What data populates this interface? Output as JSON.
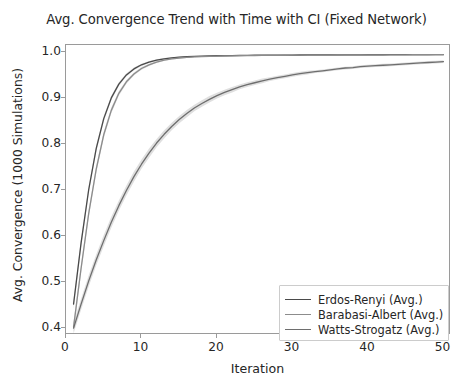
{
  "chart_data": {
    "type": "line",
    "title": "Avg. Convergence Trend with Time with CI (Fixed Network)",
    "xlabel": "Iteration",
    "ylabel": "Avg. Convergence (1000 Simulations)",
    "xlim": [
      0,
      51
    ],
    "ylim": [
      0.385,
      1.015
    ],
    "xticks": [
      0,
      10,
      20,
      30,
      40,
      50
    ],
    "xtick_labels": [
      "0",
      "10",
      "20",
      "30",
      "40",
      "50"
    ],
    "yticks": [
      0.4,
      0.5,
      0.6,
      0.7,
      0.8,
      0.9,
      1.0
    ],
    "ytick_labels": [
      "0.4",
      "0.5",
      "0.6",
      "0.7",
      "0.8",
      "0.9",
      "1.0"
    ],
    "grid": false,
    "legend_position": "lower right",
    "confidence_interval": true,
    "x": [
      1,
      2,
      3,
      4,
      5,
      6,
      7,
      8,
      9,
      10,
      11,
      12,
      13,
      14,
      15,
      16,
      17,
      18,
      19,
      20,
      21,
      22,
      23,
      24,
      25,
      26,
      27,
      28,
      29,
      30,
      31,
      32,
      33,
      34,
      35,
      36,
      37,
      38,
      39,
      40,
      41,
      42,
      43,
      44,
      45,
      46,
      47,
      48,
      49,
      50
    ],
    "series": [
      {
        "name": "Erdos-Renyi (Avg.)",
        "color": "#4a4a4a",
        "values": [
          0.452,
          0.585,
          0.7,
          0.79,
          0.855,
          0.9,
          0.93,
          0.95,
          0.963,
          0.972,
          0.978,
          0.982,
          0.985,
          0.987,
          0.9885,
          0.9895,
          0.9902,
          0.9908,
          0.9912,
          0.9916,
          0.9919,
          0.9921,
          0.9923,
          0.9925,
          0.9927,
          0.9928,
          0.9929,
          0.993,
          0.9931,
          0.9932,
          0.9933,
          0.9934,
          0.9934,
          0.9935,
          0.9935,
          0.9936,
          0.9936,
          0.9937,
          0.9937,
          0.9938,
          0.9938,
          0.9938,
          0.9939,
          0.9939,
          0.9939,
          0.994,
          0.994,
          0.994,
          0.994,
          0.9941
        ],
        "ci_halfwidth": [
          0.01,
          0.009,
          0.008,
          0.007,
          0.006,
          0.005,
          0.004,
          0.0035,
          0.003,
          0.0025,
          0.002,
          0.0018,
          0.0016,
          0.0014,
          0.0012,
          0.0011,
          0.001,
          0.001,
          0.0009,
          0.0009,
          0.0008,
          0.0008,
          0.0008,
          0.0008,
          0.0008,
          0.0007,
          0.0007,
          0.0007,
          0.0007,
          0.0007,
          0.0007,
          0.0007,
          0.0007,
          0.0007,
          0.0007,
          0.0007,
          0.0007,
          0.0007,
          0.0007,
          0.0007,
          0.0007,
          0.0007,
          0.0007,
          0.0007,
          0.0007,
          0.0007,
          0.0007,
          0.0007,
          0.0007,
          0.0007
        ]
      },
      {
        "name": "Barabasi-Albert (Avg.)",
        "color": "#8c8c8c",
        "values": [
          0.402,
          0.53,
          0.648,
          0.745,
          0.82,
          0.873,
          0.91,
          0.935,
          0.952,
          0.964,
          0.972,
          0.978,
          0.982,
          0.985,
          0.9868,
          0.9881,
          0.989,
          0.9897,
          0.9903,
          0.9907,
          0.9911,
          0.9914,
          0.9917,
          0.9919,
          0.9921,
          0.9923,
          0.9924,
          0.9926,
          0.9927,
          0.9928,
          0.9929,
          0.993,
          0.9931,
          0.9932,
          0.9932,
          0.9933,
          0.9934,
          0.9934,
          0.9935,
          0.9935,
          0.9936,
          0.9936,
          0.9937,
          0.9937,
          0.9937,
          0.9938,
          0.9938,
          0.9938,
          0.9939,
          0.9939
        ],
        "ci_halfwidth": [
          0.011,
          0.01,
          0.009,
          0.008,
          0.007,
          0.006,
          0.005,
          0.004,
          0.0035,
          0.003,
          0.0025,
          0.002,
          0.0018,
          0.0016,
          0.0014,
          0.0012,
          0.0011,
          0.001,
          0.001,
          0.0009,
          0.0009,
          0.0008,
          0.0008,
          0.0008,
          0.0008,
          0.0008,
          0.0007,
          0.0007,
          0.0007,
          0.0007,
          0.0007,
          0.0007,
          0.0007,
          0.0007,
          0.0007,
          0.0007,
          0.0007,
          0.0007,
          0.0007,
          0.0007,
          0.0007,
          0.0007,
          0.0007,
          0.0007,
          0.0007,
          0.0007,
          0.0007,
          0.0007,
          0.0007,
          0.0007
        ]
      },
      {
        "name": "Watts-Strogatz (Avg.)",
        "color": "#6e6e6e",
        "values": [
          0.4,
          0.452,
          0.502,
          0.548,
          0.59,
          0.63,
          0.666,
          0.699,
          0.729,
          0.756,
          0.78,
          0.802,
          0.821,
          0.838,
          0.853,
          0.866,
          0.878,
          0.888,
          0.897,
          0.905,
          0.912,
          0.918,
          0.924,
          0.929,
          0.933,
          0.937,
          0.941,
          0.944,
          0.947,
          0.95,
          0.953,
          0.955,
          0.957,
          0.959,
          0.961,
          0.963,
          0.965,
          0.966,
          0.968,
          0.969,
          0.97,
          0.971,
          0.972,
          0.973,
          0.974,
          0.975,
          0.976,
          0.977,
          0.978,
          0.979
        ],
        "ci_halfwidth": [
          0.012,
          0.012,
          0.012,
          0.012,
          0.012,
          0.012,
          0.011,
          0.011,
          0.011,
          0.01,
          0.01,
          0.009,
          0.009,
          0.008,
          0.008,
          0.008,
          0.007,
          0.007,
          0.007,
          0.006,
          0.006,
          0.006,
          0.005,
          0.005,
          0.005,
          0.005,
          0.004,
          0.004,
          0.004,
          0.004,
          0.004,
          0.004,
          0.003,
          0.003,
          0.003,
          0.003,
          0.003,
          0.003,
          0.003,
          0.003,
          0.003,
          0.003,
          0.003,
          0.003,
          0.003,
          0.003,
          0.003,
          0.003,
          0.003,
          0.003
        ]
      }
    ]
  },
  "style": {
    "background": "#ffffff",
    "spine_color": "#9a9a9a",
    "text_color": "#262626",
    "ci_fill": "#b8b8b8"
  }
}
